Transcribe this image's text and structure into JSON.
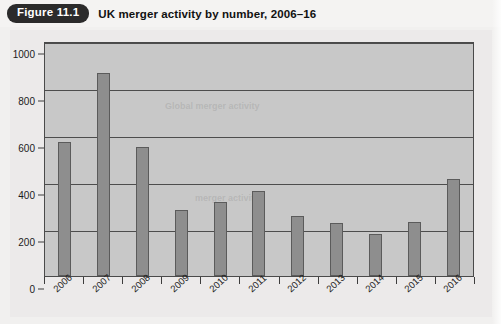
{
  "caption": {
    "badge_label": "Figure 11.1",
    "title": "UK merger activity by number, 2006–16"
  },
  "colors": {
    "badge_bg": "#2b2b2b",
    "badge_text": "#ffffff",
    "plot_bg": "#c8c8c8",
    "bar_fill": "#8e8e8e",
    "bar_border": "#5b5b5b",
    "gridline": "#4d4d4d",
    "page_bg": "#f1f0ef"
  },
  "ghost_text": {
    "line1": "Global merger activity",
    "line2": "merger activity"
  },
  "chart_data": {
    "type": "bar",
    "title": "UK merger activity by number, 2006–16",
    "xlabel": "",
    "ylabel": "",
    "categories": [
      "2006",
      "2007",
      "2008",
      "2009",
      "2010",
      "2011",
      "2012",
      "2013",
      "2014",
      "2015",
      "2016"
    ],
    "values": [
      570,
      862,
      550,
      280,
      315,
      360,
      255,
      225,
      178,
      230,
      412
    ],
    "ylim": [
      0,
      1000
    ],
    "yticks": [
      0,
      200,
      400,
      600,
      800,
      1000
    ],
    "ytick_labels": [
      "0",
      "200",
      "400",
      "600",
      "800",
      "1000"
    ],
    "grid": true,
    "grid_axis": "y",
    "legend": false,
    "bar_count": 11
  }
}
